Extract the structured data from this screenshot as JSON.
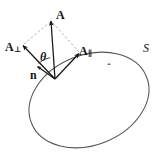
{
  "figure": {
    "background_color": "#ffffff",
    "stroke_color": "#1a1a1a",
    "curve_color": "#4a4a4a",
    "dashed_color": "#9a9a9a",
    "width": 158,
    "height": 154
  },
  "labels": {
    "vector_a": "A",
    "vector_a_perp": "A",
    "vector_a_perp_sub": "⊥",
    "vector_a_par": "A",
    "vector_a_par_sub": "∥",
    "angle_theta": "θ",
    "normal_n": "n",
    "normal_hat": "ˆ",
    "surface_s": "S"
  },
  "geometry": {
    "origin": {
      "x": 55,
      "y": 79
    },
    "tip_a": {
      "x": 51,
      "y": 20
    },
    "tip_a_perp": {
      "x": 22,
      "y": 45
    },
    "tip_a_par": {
      "x": 80,
      "y": 53
    },
    "tip_n_hat": {
      "x": 36,
      "y": 67
    },
    "arc_radius": 22,
    "ellipse": {
      "center_x": 89,
      "center_y": 100,
      "radius_x": 62,
      "radius_y": 45,
      "rotation_deg": -22
    }
  },
  "annotations": {
    "description": "Vector A is resolved into a component A-perpendicular along the surface normal n-hat and a component A-parallel tangent to the surface S; theta is the angle between n-hat and A.",
    "dashed_construction": "parallelogram completion from A-perp and A-par tips to the tip of A"
  }
}
